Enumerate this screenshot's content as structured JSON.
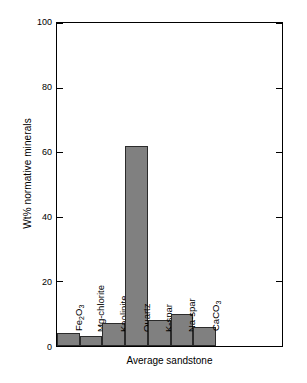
{
  "chart_data": {
    "type": "bar",
    "title": "",
    "xlabel": "Average sandstone",
    "ylabel": "Wt% normative minerals",
    "categories": [
      "Fe2O3",
      "Mg-chlorite",
      "Kaolinite",
      "Quartz",
      "K-spar",
      "Na-spar",
      "CaCO3"
    ],
    "category_labels_html": [
      "Fe<sub>2</sub>O<sub>3</sub>",
      "Mg-chlorite",
      "Kaolinite",
      "Quartz",
      "K-spar",
      "Na-spar",
      "CaCO<sub>3</sub>"
    ],
    "values": [
      4,
      3,
      7,
      62,
      8,
      10,
      6
    ],
    "ylim": [
      0,
      100
    ],
    "yticks": [
      0,
      20,
      40,
      60,
      80,
      100
    ],
    "ytick_labels": [
      "0",
      "20",
      "40",
      "60",
      "80",
      "100"
    ],
    "grid": false,
    "legend": null,
    "bar_color": "#808080",
    "bar_edge_color": "#2b2b2b",
    "axis_color": "#000000",
    "background_color": "#ffffff",
    "labels_inside_rotated": true
  }
}
